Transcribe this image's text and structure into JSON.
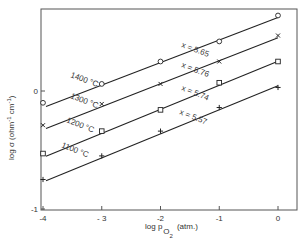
{
  "chart_data": {
    "type": "line",
    "title": "",
    "xlabel": "log p_O2 (atm.)",
    "ylabel": "log σ (ohm⁻¹ cm⁻¹)",
    "xlim": [
      -4.05,
      0.3
    ],
    "ylim": [
      -1.0,
      0.7
    ],
    "x_ticks": [
      -4,
      -3,
      -2,
      -1,
      0
    ],
    "y_ticks": [
      -1,
      0
    ],
    "grid": false,
    "legend": "inline labels on lines",
    "x": [
      -4,
      -3,
      -2,
      -1,
      0
    ],
    "series": [
      {
        "name": "1400 °C",
        "marker": "circle",
        "x_param": "x = 5.65",
        "values": [
          -0.1,
          0.06,
          0.25,
          0.42,
          0.64
        ]
      },
      {
        "name": "1300 °C",
        "marker": "cross",
        "x_param": "x = 5.76",
        "values": [
          -0.29,
          -0.11,
          0.06,
          0.25,
          0.47
        ]
      },
      {
        "name": "1200 °C",
        "marker": "square",
        "x_param": "x = 5.74",
        "values": [
          -0.53,
          -0.34,
          -0.16,
          0.07,
          0.25
        ]
      },
      {
        "name": "1100 °C",
        "marker": "plus",
        "x_param": "x = 5.57",
        "values": [
          -0.75,
          -0.55,
          -0.34,
          -0.14,
          0.03
        ]
      }
    ]
  },
  "labels": {
    "y_axis_main": "log σ (ohm",
    "y_axis_unit1": "-1",
    "y_axis_cm": " cm",
    "y_axis_unit2": "-1",
    "y_axis_close": ")",
    "x_axis_main": "log p",
    "x_axis_sub_O": "O",
    "x_axis_sub_2": "2",
    "x_axis_unit": "(atm.)",
    "x_tick_labels": [
      "-4",
      "- 3",
      "-2",
      "-1",
      "0"
    ],
    "y_tick_labels": [
      "0",
      "-1"
    ],
    "series_temp_labels": [
      "1400 °C",
      "1300 °C",
      "1200 °C",
      "1100 °C"
    ],
    "series_x_labels": [
      "x = 5.65",
      "x = 5.76",
      "x = 5.74",
      "x = 5.57"
    ]
  }
}
